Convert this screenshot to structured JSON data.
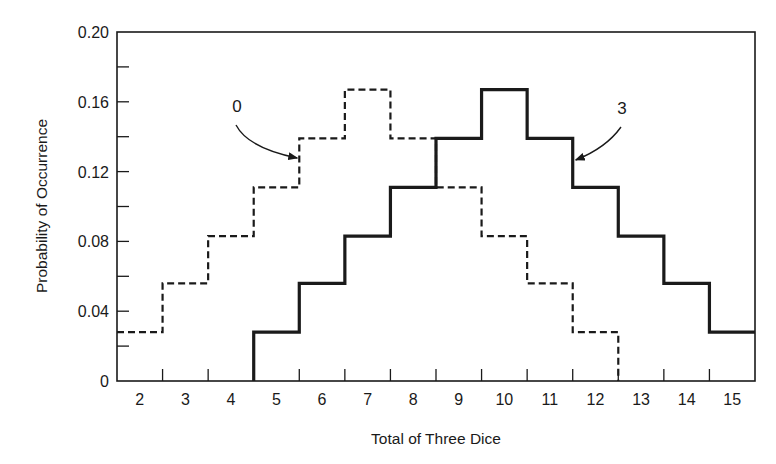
{
  "chart_data": {
    "type": "line",
    "subtype": "step",
    "title": "",
    "xlabel": "Total of Three Dice",
    "ylabel": "Probability of Occurrence",
    "xlim": [
      1.5,
      15.5
    ],
    "ylim": [
      0,
      0.2
    ],
    "grid": false,
    "legend": "none (curves labeled by annotation arrows)",
    "x_ticks": [
      2,
      3,
      4,
      5,
      6,
      7,
      8,
      9,
      10,
      11,
      12,
      13,
      14,
      15
    ],
    "y_ticks": [
      "0",
      "0.04",
      "0.08",
      "0.12",
      "0.16",
      "0.20"
    ],
    "y_minor_ticks": [
      0.02,
      0.06,
      0.1,
      0.14,
      0.18
    ],
    "series": [
      {
        "name": "0",
        "style": "dashed",
        "x": [
          2,
          3,
          4,
          5,
          6,
          7,
          8,
          9,
          10,
          11,
          12
        ],
        "values": [
          0.028,
          0.056,
          0.083,
          0.111,
          0.139,
          0.167,
          0.139,
          0.111,
          0.083,
          0.056,
          0.028
        ]
      },
      {
        "name": "3",
        "style": "solid",
        "x": [
          5,
          6,
          7,
          8,
          9,
          10,
          11,
          12,
          13,
          14,
          15
        ],
        "values": [
          0.028,
          0.056,
          0.083,
          0.111,
          0.139,
          0.167,
          0.139,
          0.111,
          0.083,
          0.056,
          0.028
        ]
      }
    ],
    "annotations": [
      {
        "text": "0",
        "target_series": "0",
        "points_to_x": 5.5,
        "points_to_y": 0.12
      },
      {
        "text": "3",
        "target_series": "3",
        "points_to_x": 11.5,
        "points_to_y": 0.13
      }
    ]
  },
  "colors": {
    "ink": "#1a1a1a",
    "background": "#ffffff"
  }
}
